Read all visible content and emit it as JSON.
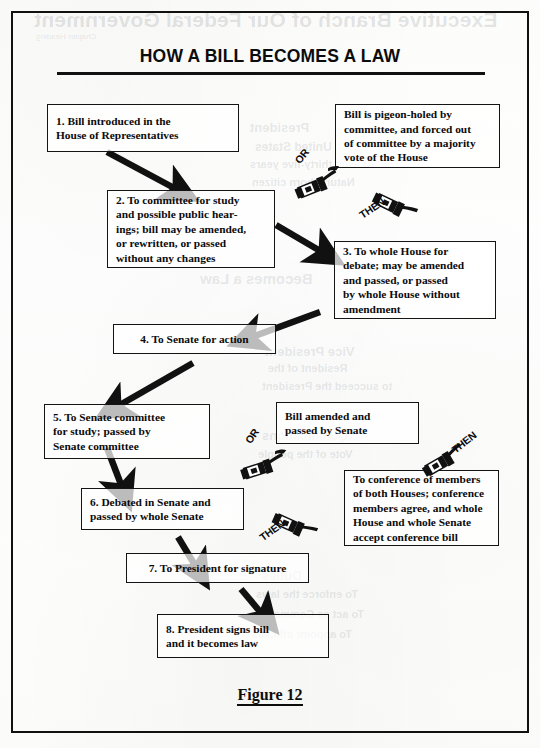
{
  "figure": {
    "title": "HOW A BILL BECOMES A LAW",
    "caption": "Figure 12"
  },
  "background_ghost_text": {
    "heading": "Executive Branch of Our Federal Government",
    "subheading": "Chapter Heading",
    "lines": [
      "President",
      "United States",
      "At least thirty-five years",
      "Natural born citizen",
      "Becomes a Law",
      "Vice President",
      "Resident of the",
      "to succeed the President",
      "Qualifications",
      "Vote of the people",
      "Duties",
      "To enforce the laws",
      "To act as Commander",
      "To appoint officials"
    ]
  },
  "boxes": [
    {
      "id": "box-1",
      "name": "step-1-bill-introduced",
      "lines": [
        "1. Bill introduced in the",
        "House of Representatives"
      ]
    },
    {
      "id": "box-pigeonhole",
      "name": "bill-pigeon-holed",
      "lines": [
        "Bill is pigeon-holed by",
        "committee, and forced out",
        "of committee by a majority",
        "vote of the House"
      ]
    },
    {
      "id": "box-2",
      "name": "step-2-to-committee",
      "lines": [
        "2. To committee for study",
        "and possible public hear-",
        "ings; bill may be amended,",
        "or rewritten, or passed",
        "without any changes"
      ]
    },
    {
      "id": "box-3",
      "name": "step-3-to-whole-house",
      "lines": [
        "3. To whole House for",
        "debate; may be amended",
        "and passed, or passed",
        "by whole House without",
        "amendment"
      ]
    },
    {
      "id": "box-4",
      "name": "step-4-to-senate",
      "lines": [
        "4. To Senate for action"
      ]
    },
    {
      "id": "box-5",
      "name": "step-5-senate-committee",
      "lines": [
        "5. To Senate committee",
        "for study; passed by",
        "Senate committee"
      ]
    },
    {
      "id": "box-amended",
      "name": "bill-amended-by-senate",
      "lines": [
        "Bill amended and",
        "passed by Senate"
      ]
    },
    {
      "id": "box-6",
      "name": "step-6-debated-in-senate",
      "lines": [
        "6. Debated in Senate and",
        "passed by whole Senate"
      ]
    },
    {
      "id": "box-conference",
      "name": "to-conference-of-members",
      "lines": [
        "To conference of members",
        "of both Houses; conference",
        "members agree, and whole",
        "House and whole Senate",
        "accept conference bill"
      ]
    },
    {
      "id": "box-7",
      "name": "step-7-to-president",
      "lines": [
        "7. To President for signature"
      ]
    },
    {
      "id": "box-8",
      "name": "step-8-president-signs",
      "lines": [
        "8. President signs bill",
        "and it becomes law"
      ]
    }
  ],
  "connectors": [
    {
      "id": "conn-or-1",
      "label": "OR",
      "icon": "pointing-hand-icon"
    },
    {
      "id": "conn-then-1",
      "label": "THEN",
      "icon": "pointing-hand-icon"
    },
    {
      "id": "conn-or-2",
      "label": "OR",
      "icon": "pointing-hand-icon"
    },
    {
      "id": "conn-then-2",
      "label": "THEN",
      "icon": "pointing-hand-icon"
    },
    {
      "id": "conn-then-3",
      "label": "THEN",
      "icon": "pointing-hand-icon"
    }
  ],
  "colors": {
    "ink": "#111111",
    "paper": "#fdfdfb",
    "ghost": "rgba(90,95,105,0.16)"
  }
}
